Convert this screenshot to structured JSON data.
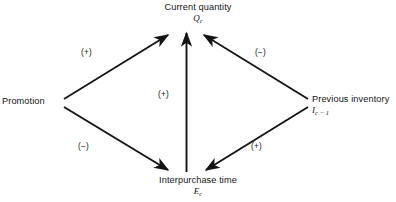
{
  "figure": {
    "type": "causal-path-diagram",
    "background_color": "#ffffff",
    "line_color": "#141414"
  },
  "nodes": {
    "current_quantity": {
      "label": "Current quantity",
      "symbol": "Q",
      "subscript": "c",
      "position": "top-center"
    },
    "promotion": {
      "label": "Promotion",
      "symbol": "",
      "subscript": "",
      "position": "middle-left"
    },
    "previous_inventory": {
      "label": "Previous inventory",
      "symbol": "I",
      "subscript": "c − 1",
      "position": "middle-right"
    },
    "interpurchase_time": {
      "label": "Interpurchase time",
      "symbol": "E",
      "subscript": "c",
      "position": "bottom-center"
    }
  },
  "edges": [
    {
      "id": "promotion-to-current-quantity",
      "from": "promotion",
      "to": "current_quantity",
      "sign": "(+)"
    },
    {
      "id": "previous-inventory-to-current-quantity",
      "from": "previous_inventory",
      "to": "current_quantity",
      "sign": "(−)"
    },
    {
      "id": "interpurchase-time-to-current-quantity",
      "from": "interpurchase_time",
      "to": "current_quantity",
      "sign": "(+)"
    },
    {
      "id": "promotion-to-interpurchase-time",
      "from": "promotion",
      "to": "interpurchase_time",
      "sign": "(−)"
    },
    {
      "id": "previous-inventory-to-interpurchase-time",
      "from": "previous_inventory",
      "to": "interpurchase_time",
      "sign": "(+)"
    }
  ],
  "signs": {
    "promotion_quantity": "(+)",
    "inventory_quantity": "(−)",
    "time_quantity": "(+)",
    "promotion_time": "(−)",
    "inventory_time": "(+)"
  }
}
